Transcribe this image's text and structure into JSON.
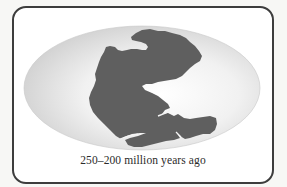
{
  "figure": {
    "caption": "250–200 million years ago",
    "colors": {
      "frame_border": "#3d3d3d",
      "landmass": "#5f5f5f",
      "ocean_center": "#ffffff",
      "ocean_edge": "#d6d6d6",
      "background": "#ffffff"
    },
    "icons": {
      "map": "pangaea-map"
    }
  }
}
